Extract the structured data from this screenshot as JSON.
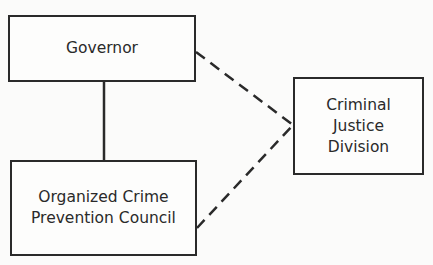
{
  "diagram": {
    "nodes": [
      {
        "id": "governor",
        "lines": [
          "Governor"
        ]
      },
      {
        "id": "ocpc",
        "lines": [
          "Organized Crime",
          "Prevention Council"
        ]
      },
      {
        "id": "cjd",
        "lines": [
          "Criminal",
          "Justice",
          "Division"
        ]
      }
    ],
    "edges": [
      {
        "from": "governor",
        "to": "ocpc",
        "style": "solid"
      },
      {
        "from": "governor",
        "to": "cjd",
        "style": "dashed"
      },
      {
        "from": "ocpc",
        "to": "cjd",
        "style": "dashed"
      }
    ],
    "colors": {
      "line": "#2a2a2a",
      "background": "#fbfbfa"
    }
  }
}
